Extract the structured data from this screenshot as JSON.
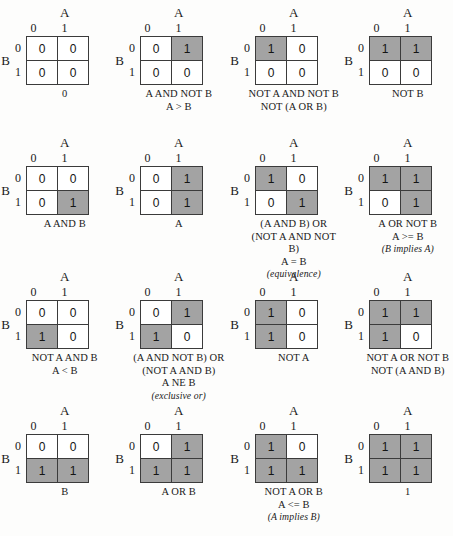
{
  "figure": {
    "axis_top_label": "A",
    "axis_side_label": "B",
    "col_headers": [
      "0",
      "1"
    ],
    "row_headers": [
      "0",
      "1"
    ],
    "shaded_color": "#a3a3a3",
    "unshaded_color": "#ffffff",
    "border_color": "#3b3b3b"
  },
  "maps": [
    {
      "id": "const-0",
      "values": [
        [
          "0",
          "0"
        ],
        [
          "0",
          "0"
        ]
      ],
      "shaded": [
        [
          false,
          false
        ],
        [
          false,
          false
        ]
      ],
      "captions": [
        {
          "text": "0",
          "style": "plain"
        }
      ]
    },
    {
      "id": "a-and-not-b",
      "values": [
        [
          "0",
          "1"
        ],
        [
          "0",
          "0"
        ]
      ],
      "shaded": [
        [
          false,
          true
        ],
        [
          false,
          false
        ]
      ],
      "captions": [
        {
          "text": "A AND NOT B",
          "style": "plain"
        },
        {
          "text": "A > B",
          "style": "plain"
        }
      ]
    },
    {
      "id": "not-a-and-not-b",
      "values": [
        [
          "1",
          "0"
        ],
        [
          "0",
          "0"
        ]
      ],
      "shaded": [
        [
          true,
          false
        ],
        [
          false,
          false
        ]
      ],
      "captions": [
        {
          "text": "NOT A AND NOT B",
          "style": "plain"
        },
        {
          "text": "NOT (A OR B)",
          "style": "plain"
        }
      ]
    },
    {
      "id": "not-b",
      "values": [
        [
          "1",
          "1"
        ],
        [
          "0",
          "0"
        ]
      ],
      "shaded": [
        [
          true,
          true
        ],
        [
          false,
          false
        ]
      ],
      "captions": [
        {
          "text": "NOT B",
          "style": "plain"
        }
      ]
    },
    {
      "id": "a-and-b",
      "values": [
        [
          "0",
          "0"
        ],
        [
          "0",
          "1"
        ]
      ],
      "shaded": [
        [
          false,
          false
        ],
        [
          false,
          true
        ]
      ],
      "captions": [
        {
          "text": "A AND B",
          "style": "plain"
        }
      ]
    },
    {
      "id": "a",
      "values": [
        [
          "0",
          "1"
        ],
        [
          "0",
          "1"
        ]
      ],
      "shaded": [
        [
          false,
          true
        ],
        [
          false,
          true
        ]
      ],
      "captions": [
        {
          "text": "A",
          "style": "plain"
        }
      ]
    },
    {
      "id": "equivalence",
      "values": [
        [
          "1",
          "0"
        ],
        [
          "0",
          "1"
        ]
      ],
      "shaded": [
        [
          true,
          false
        ],
        [
          false,
          true
        ]
      ],
      "captions": [
        {
          "text": "(A AND B) OR (NOT A AND NOT B)",
          "style": "wrap"
        },
        {
          "text": "A = B",
          "style": "plain"
        },
        {
          "text": "(equivalence)",
          "style": "ital"
        }
      ]
    },
    {
      "id": "a-or-not-b",
      "values": [
        [
          "1",
          "1"
        ],
        [
          "0",
          "1"
        ]
      ],
      "shaded": [
        [
          true,
          true
        ],
        [
          false,
          true
        ]
      ],
      "captions": [
        {
          "text": "A OR NOT B",
          "style": "plain"
        },
        {
          "text": "A >= B",
          "style": "plain"
        },
        {
          "text": "(B implies A)",
          "style": "ital"
        }
      ]
    },
    {
      "id": "not-a-and-b",
      "values": [
        [
          "0",
          "0"
        ],
        [
          "1",
          "0"
        ]
      ],
      "shaded": [
        [
          false,
          false
        ],
        [
          true,
          false
        ]
      ],
      "captions": [
        {
          "text": "NOT A AND B",
          "style": "plain"
        },
        {
          "text": "A < B",
          "style": "plain"
        }
      ]
    },
    {
      "id": "exclusive-or",
      "values": [
        [
          "0",
          "1"
        ],
        [
          "1",
          "0"
        ]
      ],
      "shaded": [
        [
          false,
          true
        ],
        [
          true,
          false
        ]
      ],
      "captions": [
        {
          "text": "(A AND NOT B) OR (NOT A AND B)",
          "style": "wrap"
        },
        {
          "text": "A NE B",
          "style": "plain"
        },
        {
          "text": "(exclusive or)",
          "style": "ital"
        }
      ]
    },
    {
      "id": "not-a",
      "values": [
        [
          "1",
          "0"
        ],
        [
          "1",
          "0"
        ]
      ],
      "shaded": [
        [
          true,
          false
        ],
        [
          true,
          false
        ]
      ],
      "captions": [
        {
          "text": "NOT A",
          "style": "plain"
        }
      ]
    },
    {
      "id": "nand",
      "values": [
        [
          "1",
          "1"
        ],
        [
          "1",
          "0"
        ]
      ],
      "shaded": [
        [
          true,
          true
        ],
        [
          true,
          false
        ]
      ],
      "captions": [
        {
          "text": "NOT A OR NOT B",
          "style": "plain"
        },
        {
          "text": "NOT (A AND B)",
          "style": "plain"
        }
      ]
    },
    {
      "id": "b",
      "values": [
        [
          "0",
          "0"
        ],
        [
          "1",
          "1"
        ]
      ],
      "shaded": [
        [
          false,
          false
        ],
        [
          true,
          true
        ]
      ],
      "captions": [
        {
          "text": "B",
          "style": "plain"
        }
      ]
    },
    {
      "id": "a-or-b",
      "values": [
        [
          "0",
          "1"
        ],
        [
          "1",
          "1"
        ]
      ],
      "shaded": [
        [
          false,
          true
        ],
        [
          true,
          true
        ]
      ],
      "captions": [
        {
          "text": "A OR B",
          "style": "plain"
        }
      ]
    },
    {
      "id": "not-a-or-b",
      "values": [
        [
          "1",
          "0"
        ],
        [
          "1",
          "1"
        ]
      ],
      "shaded": [
        [
          true,
          false
        ],
        [
          true,
          true
        ]
      ],
      "captions": [
        {
          "text": "NOT A OR B",
          "style": "plain"
        },
        {
          "text": "A <= B",
          "style": "plain"
        },
        {
          "text": "(A implies B)",
          "style": "ital"
        }
      ]
    },
    {
      "id": "const-1",
      "values": [
        [
          "1",
          "1"
        ],
        [
          "1",
          "1"
        ]
      ],
      "shaded": [
        [
          true,
          true
        ],
        [
          true,
          true
        ]
      ],
      "captions": [
        {
          "text": "1",
          "style": "plain"
        }
      ]
    }
  ]
}
